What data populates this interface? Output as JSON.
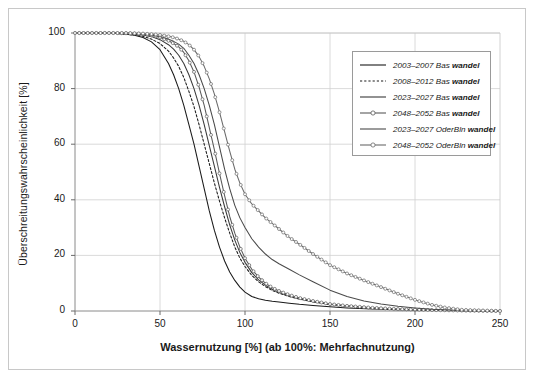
{
  "chart_data": {
    "type": "line",
    "title": "",
    "xlabel": "Wassernutzung [%] (ab 100%: Mehrfachnutzung)",
    "ylabel": "Überschreitungswahrscheinlichkeit [%]",
    "xlim": [
      0,
      250
    ],
    "ylim": [
      0,
      100
    ],
    "xticks": [
      0,
      50,
      100,
      150,
      200,
      250
    ],
    "yticks": [
      0,
      20,
      40,
      60,
      80,
      100
    ],
    "grid": true,
    "legend_position": "upper right",
    "series": [
      {
        "name": "2003–2007 Bas wandel",
        "period": "2003–2007",
        "scenario": "Bas",
        "suffix": "wandel",
        "style": "solid",
        "marker": "none",
        "color": "#1a1a1a",
        "x": [
          0,
          10,
          20,
          30,
          35,
          40,
          45,
          50,
          55,
          58,
          61,
          64,
          67,
          70,
          73,
          76,
          79,
          82,
          85,
          88,
          91,
          94,
          97,
          100,
          104,
          108,
          112,
          116,
          120,
          126,
          132,
          140,
          150,
          160,
          175,
          190,
          210,
          230,
          250
        ],
        "y": [
          100,
          100,
          100,
          99.6,
          99.2,
          98.4,
          96.8,
          94,
          89,
          85,
          80,
          74,
          67,
          60,
          52,
          44,
          36,
          29,
          23,
          18,
          14,
          11,
          8.6,
          6.8,
          5.2,
          4.4,
          3.9,
          3.5,
          3.2,
          2.8,
          2.4,
          2.0,
          1.5,
          1.1,
          0.7,
          0.45,
          0.25,
          0.1,
          0
        ]
      },
      {
        "name": "2008–2012 Bas wandel",
        "period": "2008–2012",
        "scenario": "Bas",
        "suffix": "wandel",
        "style": "dotted",
        "marker": "none",
        "color": "#1a1a1a",
        "x": [
          0,
          10,
          20,
          30,
          35,
          40,
          45,
          50,
          55,
          58,
          61,
          64,
          67,
          70,
          73,
          76,
          79,
          82,
          85,
          88,
          91,
          94,
          97,
          100,
          104,
          108,
          112,
          116,
          120,
          126,
          132,
          140,
          150,
          160,
          175,
          190,
          210,
          230,
          250
        ],
        "y": [
          100,
          100,
          99.9,
          99.6,
          99.3,
          98.8,
          97.8,
          96.2,
          93.5,
          91,
          88,
          84,
          79,
          73.5,
          67,
          60,
          53,
          46,
          39.5,
          33.5,
          28,
          23,
          19,
          16,
          12.8,
          10.5,
          8.8,
          7.4,
          6.4,
          5.2,
          4.3,
          3.3,
          2.3,
          1.7,
          1.0,
          0.6,
          0.3,
          0.1,
          0
        ]
      },
      {
        "name": "2023–2027 Bas wandel",
        "period": "2023–2027",
        "scenario": "Bas",
        "suffix": "wandel",
        "style": "solid",
        "marker": "none",
        "color": "#3a3a3a",
        "x": [
          0,
          10,
          20,
          30,
          35,
          40,
          45,
          50,
          55,
          58,
          61,
          64,
          67,
          70,
          73,
          76,
          79,
          82,
          85,
          88,
          91,
          94,
          97,
          100,
          104,
          108,
          112,
          116,
          120,
          126,
          132,
          140,
          150,
          160,
          175,
          190,
          210,
          230,
          250
        ],
        "y": [
          100,
          100,
          100,
          99.8,
          99.6,
          99.3,
          98.7,
          97.6,
          95.8,
          94.2,
          92,
          89,
          85,
          80,
          74,
          67,
          59.5,
          52,
          44.5,
          37.5,
          31,
          25.5,
          21,
          17.5,
          13.8,
          11.2,
          9.3,
          7.8,
          6.7,
          5.4,
          4.4,
          3.4,
          2.4,
          1.8,
          1.1,
          0.65,
          0.32,
          0.12,
          0
        ]
      },
      {
        "name": "2048–2052 Bas wandel",
        "period": "2048–2052",
        "scenario": "Bas",
        "suffix": "wandel",
        "style": "solid",
        "marker": "circle",
        "color": "#5a5a5a",
        "x": [
          0,
          10,
          20,
          30,
          35,
          40,
          45,
          50,
          55,
          58,
          61,
          64,
          67,
          70,
          73,
          76,
          79,
          82,
          85,
          88,
          91,
          94,
          97,
          100,
          104,
          108,
          112,
          116,
          120,
          126,
          132,
          140,
          150,
          160,
          175,
          190,
          210,
          230,
          250
        ],
        "y": [
          100,
          100,
          100,
          99.9,
          99.8,
          99.6,
          99.2,
          98.4,
          97.2,
          96.2,
          95,
          93,
          90,
          86,
          80.5,
          74,
          66,
          58,
          49.5,
          41.5,
          34,
          28,
          23,
          19,
          15,
          12.2,
          10,
          8.4,
          7.2,
          5.8,
          4.7,
          3.6,
          2.5,
          1.85,
          1.15,
          0.7,
          0.35,
          0.13,
          0
        ]
      },
      {
        "name": "2023–2027 OderBln wandel",
        "period": "2023–2027",
        "scenario": "OderBln",
        "suffix": "wandel",
        "style": "solid",
        "marker": "none",
        "color": "#4a4a4a",
        "x": [
          0,
          10,
          20,
          30,
          35,
          40,
          45,
          50,
          55,
          58,
          61,
          64,
          67,
          70,
          73,
          76,
          79,
          82,
          85,
          88,
          91,
          94,
          97,
          100,
          104,
          108,
          112,
          116,
          120,
          126,
          132,
          140,
          150,
          160,
          170,
          180,
          190,
          200,
          210,
          225,
          250
        ],
        "y": [
          100,
          100,
          100,
          99.9,
          99.8,
          99.6,
          99.3,
          98.7,
          97.8,
          97,
          96,
          94.5,
          92,
          89,
          85,
          80,
          74,
          67,
          59,
          51,
          44,
          38,
          33.5,
          30,
          26,
          23,
          20.5,
          18.5,
          17,
          15,
          13,
          10.5,
          7.5,
          5.2,
          3.6,
          2.5,
          1.7,
          1.1,
          0.6,
          0.2,
          0
        ]
      },
      {
        "name": "2048–2052 OderBln wandel",
        "period": "2048–2052",
        "scenario": "OderBln",
        "suffix": "wandel",
        "style": "solid",
        "marker": "circle",
        "color": "#6a6a6a",
        "x": [
          0,
          10,
          20,
          30,
          35,
          40,
          45,
          50,
          55,
          58,
          61,
          64,
          67,
          70,
          73,
          76,
          79,
          82,
          85,
          88,
          91,
          94,
          97,
          100,
          104,
          108,
          112,
          116,
          120,
          126,
          132,
          140,
          150,
          160,
          170,
          180,
          190,
          200,
          210,
          218,
          228,
          250
        ],
        "y": [
          100,
          100,
          100,
          100,
          99.9,
          99.8,
          99.6,
          99.3,
          98.8,
          98.4,
          97.8,
          97,
          95.8,
          94,
          91.5,
          88,
          83.5,
          78,
          71.5,
          64.5,
          57.5,
          51,
          46,
          42,
          38.5,
          36,
          33.5,
          31.5,
          29.5,
          26.5,
          24,
          20.5,
          16.5,
          13.5,
          11,
          8.6,
          6.2,
          4.0,
          2.2,
          1.2,
          0.4,
          0
        ]
      }
    ]
  }
}
